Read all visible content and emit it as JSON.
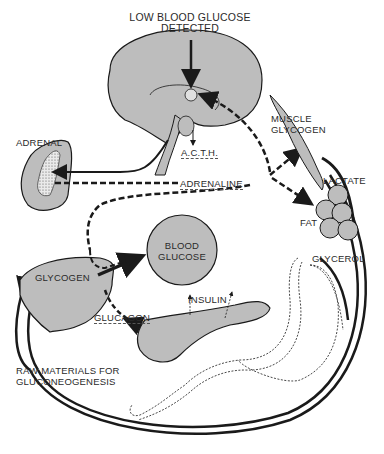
{
  "diagram": {
    "title_line1": "LOW BLOOD GLUCOSE",
    "title_line2": "DETECTED",
    "labels": {
      "adrenal": "ADRENAL",
      "acth": "A.C.T.H.",
      "adrenaline": "ADRENALINE",
      "muscle_glycogen_1": "MUSCLE",
      "muscle_glycogen_2": "GLYCOGEN",
      "lactate": "LACTATE",
      "fat": "FAT",
      "glycerol": "GLYCEROL",
      "blood_glucose_1": "BLOOD",
      "blood_glucose_2": "GLUCOSE",
      "glycogen": "GLYCOGEN",
      "insulin": "INSULIN",
      "glucagon": "GLUCAGON",
      "raw_materials_1": "RAW  MATERIALS FOR",
      "raw_materials_2": "GLUCONEOGENESIS"
    },
    "colors": {
      "organ_fill": "#bdbdbd",
      "stroke": "#1a1a1a",
      "background": "#ffffff"
    }
  }
}
